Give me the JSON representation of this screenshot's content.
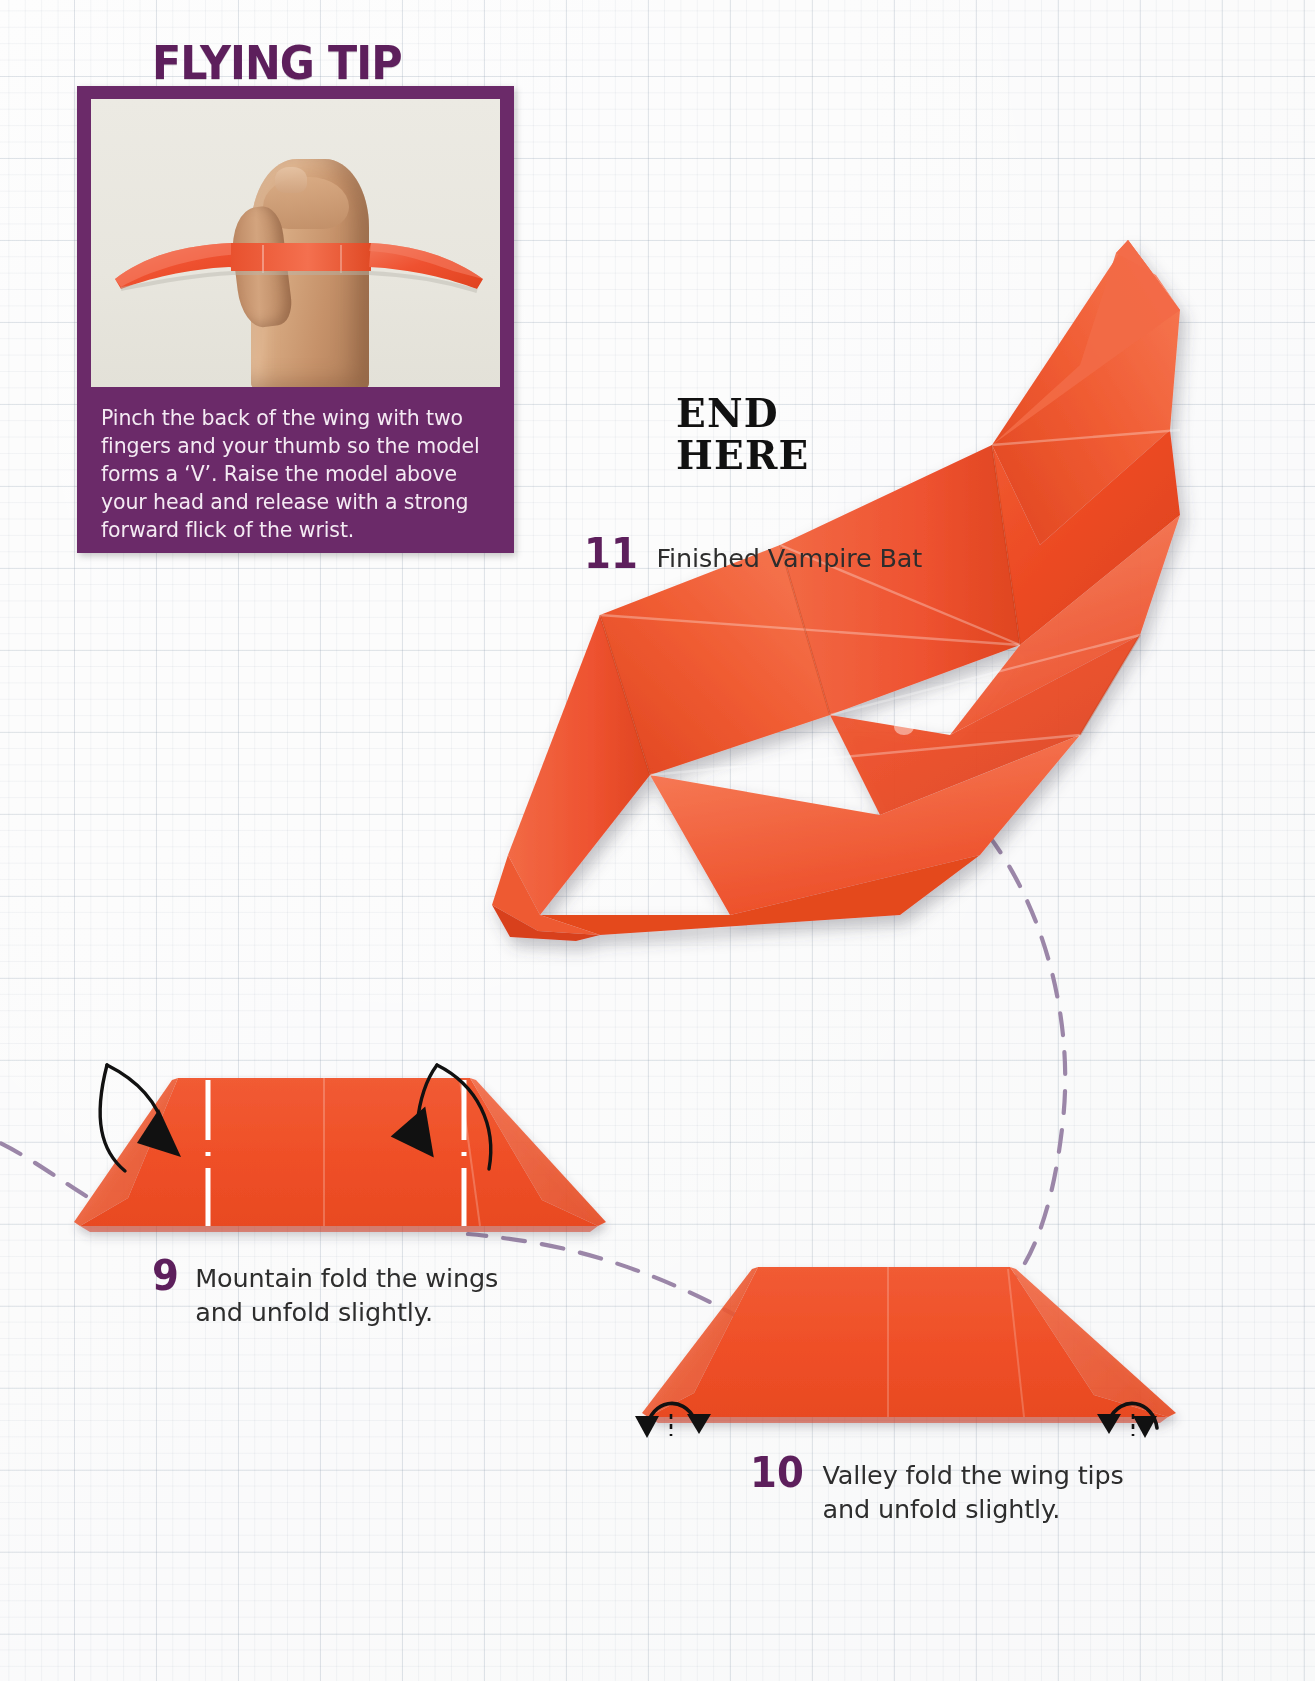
{
  "page": {
    "background": "graph-paper",
    "paper_color": "#fdfdfd",
    "grid_color": "#96a5b4"
  },
  "flying_tip": {
    "title": "FLYING TIP",
    "title_color": "#5d1f5c",
    "panel_color": "#6b2a69",
    "photo_alt": "hand-holding-paper-plane",
    "caption": "Pinch the back of the wing with two fingers and your thumb so the model forms a ‘V’. Raise the model above your head and release with a strong forward flick of the wrist."
  },
  "end_marker": {
    "line1": "END",
    "line2": "HERE"
  },
  "steps": [
    {
      "number": "9",
      "text_line1": "Mountain fold the wings",
      "text_line2": "and unfold slightly.",
      "full_text": "Mountain fold the wings and unfold slightly."
    },
    {
      "number": "10",
      "text_line1": "Valley fold the wing tips",
      "text_line2": "and unfold slightly.",
      "full_text": "Valley fold the wing tips and unfold slightly."
    },
    {
      "number": "11",
      "text_line1": "Finished Vampire Bat",
      "text_line2": "",
      "full_text": "Finished Vampire Bat"
    }
  ],
  "colors": {
    "purple": "#5d1f5c",
    "panel_purple": "#6b2a69",
    "paper_orange": "#ef4a25",
    "paper_orange_light": "#f4643f",
    "paper_orange_dark": "#d93d1c",
    "dashed_flow": "#9b86a8",
    "text_gray": "#2d2d2d"
  },
  "icons": {
    "mountain_fold_arrow": "looping-arrow-down",
    "valley_fold_arrow": "curved-arrow-up",
    "flow_connector": "dashed-curve"
  }
}
